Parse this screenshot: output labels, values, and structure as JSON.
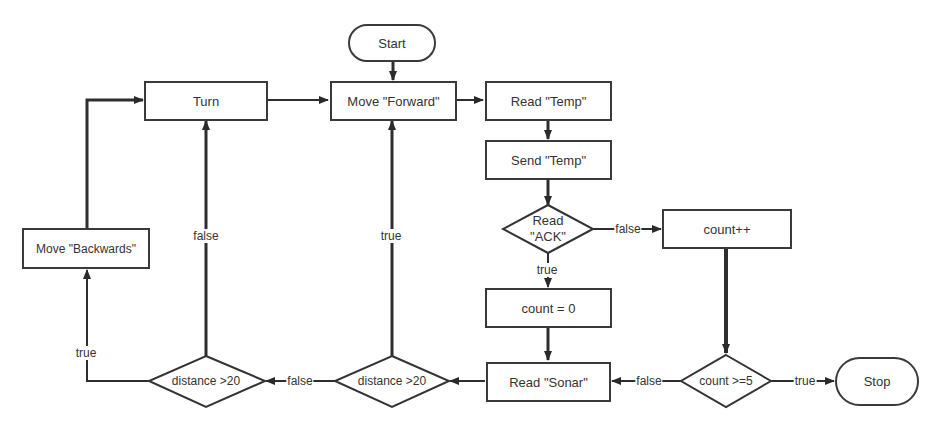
{
  "diagram": {
    "type": "flowchart",
    "nodes": {
      "start": {
        "label": "Start",
        "shape": "terminator"
      },
      "move_forward": {
        "label": "Move \"Forward\"",
        "shape": "process"
      },
      "read_temp": {
        "label": "Read \"Temp\"",
        "shape": "process"
      },
      "send_temp": {
        "label": "Send \"Temp\"",
        "shape": "process"
      },
      "read_ack": {
        "label_line1": "Read",
        "label_line2": "\"ACK\"",
        "shape": "decision"
      },
      "count_inc": {
        "label": "count++",
        "shape": "process"
      },
      "count_reset": {
        "label": "count = 0",
        "shape": "process"
      },
      "read_sonar": {
        "label": "Read \"Sonar\"",
        "shape": "process"
      },
      "count_check": {
        "label": "count >=5",
        "shape": "decision"
      },
      "stop": {
        "label": "Stop",
        "shape": "terminator"
      },
      "distance_check_1": {
        "label": "distance >20",
        "shape": "decision"
      },
      "distance_check_2": {
        "label": "distance >20",
        "shape": "decision"
      },
      "turn": {
        "label": "Turn",
        "shape": "process"
      },
      "move_backwards": {
        "label": "Move \"Backwards\"",
        "shape": "process"
      }
    },
    "edge_labels": {
      "ack_false": "false",
      "ack_true": "true",
      "count_check_false": "false",
      "count_check_true": "true",
      "distance1_true": "true",
      "distance1_false": "false",
      "distance2_true": "true",
      "distance2_false": "false"
    },
    "edges": [
      {
        "from": "start",
        "to": "move_forward"
      },
      {
        "from": "move_forward",
        "to": "read_temp"
      },
      {
        "from": "read_temp",
        "to": "send_temp"
      },
      {
        "from": "send_temp",
        "to": "read_ack"
      },
      {
        "from": "read_ack",
        "to": "count_inc",
        "label": "false"
      },
      {
        "from": "read_ack",
        "to": "count_reset",
        "label": "true"
      },
      {
        "from": "count_reset",
        "to": "read_sonar"
      },
      {
        "from": "count_inc",
        "to": "count_check"
      },
      {
        "from": "count_check",
        "to": "stop",
        "label": "true"
      },
      {
        "from": "count_check",
        "to": "read_sonar",
        "label": "false"
      },
      {
        "from": "read_sonar",
        "to": "distance_check_1"
      },
      {
        "from": "distance_check_1",
        "to": "move_forward",
        "label": "true"
      },
      {
        "from": "distance_check_1",
        "to": "distance_check_2",
        "label": "false"
      },
      {
        "from": "distance_check_2",
        "to": "turn",
        "label": "false"
      },
      {
        "from": "distance_check_2",
        "to": "move_backwards",
        "label": "true"
      },
      {
        "from": "move_backwards",
        "to": "turn"
      },
      {
        "from": "turn",
        "to": "move_forward"
      }
    ]
  }
}
